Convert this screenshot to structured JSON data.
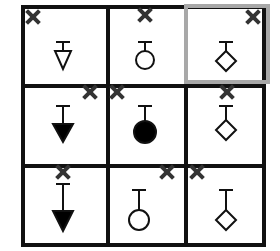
{
  "puzzle": {
    "rows": 3,
    "cols": 3,
    "highlighted_cell": {
      "row": 0,
      "col": 2
    },
    "colors": {
      "line": "#111111",
      "highlight": "#a8a8a8",
      "x_mark": "#333333",
      "fill": "#000000"
    },
    "cells": [
      {
        "row": 0,
        "col": 0,
        "shape": "triangle",
        "filled": false,
        "x_mark": "top-left"
      },
      {
        "row": 0,
        "col": 1,
        "shape": "circle",
        "filled": false,
        "x_mark": "top-center"
      },
      {
        "row": 0,
        "col": 2,
        "shape": "diamond",
        "filled": false,
        "x_mark": "top-right"
      },
      {
        "row": 1,
        "col": 0,
        "shape": "triangle",
        "filled": true,
        "x_mark": "top-right"
      },
      {
        "row": 1,
        "col": 1,
        "shape": "circle",
        "filled": true,
        "x_mark": "top-left"
      },
      {
        "row": 1,
        "col": 2,
        "shape": "diamond",
        "filled": false,
        "x_mark": "top-center"
      },
      {
        "row": 2,
        "col": 0,
        "shape": "triangle",
        "filled": true,
        "x_mark": "top-center"
      },
      {
        "row": 2,
        "col": 1,
        "shape": "circle",
        "filled": false,
        "x_mark": "top-right"
      },
      {
        "row": 2,
        "col": 2,
        "shape": "diamond",
        "filled": false,
        "x_mark": "top-left"
      }
    ]
  }
}
